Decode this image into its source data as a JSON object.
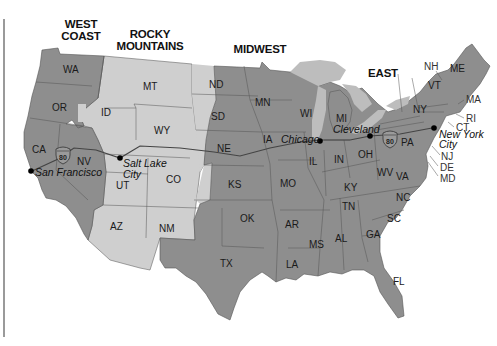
{
  "map": {
    "colors": {
      "dark_region": "#8e8e8e",
      "light_region": "#cfcfcf",
      "lakes": "#bdbdbd",
      "border": "#555555",
      "background": "#ffffff",
      "route": "#444444"
    },
    "regions": [
      {
        "id": "west-coast",
        "line1": "WEST",
        "line2": "COAST"
      },
      {
        "id": "rocky-mountains",
        "line1": "ROCKY",
        "line2": "MOUNTAINS"
      },
      {
        "id": "midwest",
        "line1": "MIDWEST"
      },
      {
        "id": "east",
        "line1": "EAST"
      }
    ],
    "states": {
      "WA": "WA",
      "OR": "OR",
      "CA": "CA",
      "NV": "NV",
      "ID": "ID",
      "MT": "MT",
      "WY": "WY",
      "UT": "UT",
      "CO": "CO",
      "AZ": "AZ",
      "NM": "NM",
      "ND": "ND",
      "SD": "SD",
      "NE": "NE",
      "KS": "KS",
      "OK": "OK",
      "TX": "TX",
      "MN": "MN",
      "IA": "IA",
      "MO": "MO",
      "AR": "AR",
      "LA": "LA",
      "WI": "WI",
      "IL": "IL",
      "MI": "MI",
      "IN": "IN",
      "OH": "OH",
      "KY": "KY",
      "TN": "TN",
      "MS": "MS",
      "AL": "AL",
      "GA": "GA",
      "FL": "FL",
      "SC": "SC",
      "NC": "NC",
      "VA": "VA",
      "WV": "WV",
      "PA": "PA",
      "NY": "NY",
      "VT": "VT",
      "NH": "NH",
      "ME": "ME",
      "MA": "MA",
      "RI": "RI",
      "CT": "CT",
      "NJ": "NJ",
      "DE": "DE",
      "MD": "MD"
    },
    "cities": [
      {
        "name": "San Francisco"
      },
      {
        "name_line1": "Salt Lake",
        "name_line2": "City"
      },
      {
        "name": "Chicago"
      },
      {
        "name": "Cleveland"
      },
      {
        "name_line1": "New York",
        "name_line2": "City"
      }
    ],
    "highway": {
      "label": "80",
      "name": "Interstate 80"
    }
  }
}
